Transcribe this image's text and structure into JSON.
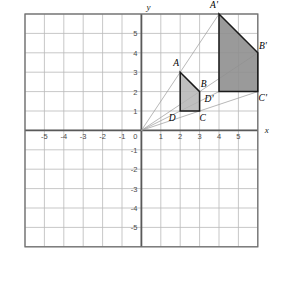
{
  "figure": {
    "axis_x_label": "x",
    "axis_y_label": "y",
    "origin_label": "0"
  },
  "grid": {
    "x_min": -6,
    "x_max": 6,
    "y_min": -6,
    "y_max": 6,
    "step": 1,
    "grid_color": "#b9b9b9",
    "axis_color": "#595959",
    "border_color": "#6f6f6f",
    "background": "#ffffff"
  },
  "ticks": {
    "x_labels": [
      "-5",
      "-4",
      "-3",
      "-2",
      "-1",
      "1",
      "2",
      "3",
      "4",
      "5"
    ],
    "x_values": [
      -5,
      -4,
      -3,
      -2,
      -1,
      1,
      2,
      3,
      4,
      5
    ],
    "y_labels": [
      "5",
      "4",
      "3",
      "2",
      "1",
      "-1",
      "-2",
      "-3",
      "-4",
      "-5"
    ],
    "y_values": [
      5,
      4,
      3,
      2,
      1,
      -1,
      -2,
      -3,
      -4,
      -5
    ]
  },
  "shapes": [
    {
      "name": "preimage",
      "id": "ABCD",
      "vertices": [
        {
          "label": "A",
          "x": 2,
          "y": 3,
          "lx": -4,
          "ly": -6
        },
        {
          "label": "B",
          "x": 3,
          "y": 2,
          "lx": 4,
          "ly": -5
        },
        {
          "label": "C",
          "x": 3,
          "y": 1,
          "lx": 3,
          "ly": 10
        },
        {
          "label": "D",
          "x": 2,
          "y": 1,
          "lx": -8,
          "ly": 10
        }
      ],
      "fill": "#b4b4b4",
      "fill_opacity": 0.85,
      "stroke": "#1a1a1a",
      "stroke_width": 1.5
    },
    {
      "name": "image",
      "id": "A'B'C'D'",
      "vertices": [
        {
          "label": "A'",
          "x": 4,
          "y": 6,
          "lx": -5,
          "ly": -6
        },
        {
          "label": "B'",
          "x": 6,
          "y": 4,
          "lx": 5,
          "ly": -4
        },
        {
          "label": "C'",
          "x": 6,
          "y": 2,
          "lx": 5,
          "ly": 9
        },
        {
          "label": "D'",
          "x": 4,
          "y": 2,
          "lx": -10,
          "ly": 10
        }
      ],
      "fill": "#8f8f8f",
      "fill_opacity": 0.9,
      "stroke": "#1a1a1a",
      "stroke_width": 1.5
    }
  ],
  "rays": {
    "from": {
      "x": 0,
      "y": 0
    },
    "to": [
      {
        "x": 4,
        "y": 6
      },
      {
        "x": 6,
        "y": 4
      },
      {
        "x": 6,
        "y": 2
      },
      {
        "x": 4,
        "y": 2
      }
    ],
    "color": "#9a9a9a",
    "width": 0.7
  }
}
